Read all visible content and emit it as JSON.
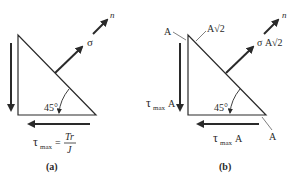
{
  "panels": [
    {
      "id": "a",
      "caption": "(a)",
      "angle_label": "45°",
      "normal_label": "n",
      "normal_force_label": "σ",
      "shear_formula": {
        "lhs_symbol": "τ",
        "lhs_subscript": "max",
        "equals": "=",
        "numerator": "Tr",
        "denominator": "J"
      }
    },
    {
      "id": "b",
      "caption": "(b)",
      "angle_label": "45°",
      "normal_label": "n",
      "normal_force_label": "σ A√2",
      "vertical_shear_label": {
        "symbol": "τ",
        "subscript": "max",
        "suffix": "A"
      },
      "horizontal_shear_label": {
        "symbol": "τ",
        "subscript": "max",
        "suffix": "A"
      },
      "area_labels": {
        "left_face": "A",
        "hypotenuse": "A√2",
        "bottom_face": "A"
      }
    }
  ],
  "colors": {
    "line": "#2a2a2a",
    "background": "#ffffff"
  }
}
